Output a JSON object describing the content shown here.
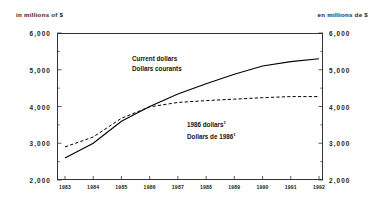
{
  "header": {
    "unit_left": "in millions of $",
    "unit_right": "en millions de $"
  },
  "annotations": {
    "current_en": "Current dollars",
    "current_fr": "Dollars courants",
    "constant_en": "1986 dollars",
    "constant_fr": "Dollars de 1986",
    "footnote_marker": "1"
  },
  "chart_data": {
    "type": "line",
    "title": "",
    "subtitle": "",
    "xlabel": "",
    "ylabel": "in millions of $",
    "ylabel_right": "en millions de $",
    "x": [
      1983,
      1984,
      1985,
      1986,
      1987,
      1988,
      1989,
      1990,
      1991,
      1992
    ],
    "categories": [
      "1983",
      "1984",
      "1985",
      "1986",
      "1987",
      "1988",
      "1989",
      "1990",
      "1991",
      "1992"
    ],
    "ylim": [
      2000,
      6000
    ],
    "yticks": [
      2000,
      3000,
      4000,
      5000,
      6000
    ],
    "ytick_labels": [
      "2,000",
      "3,000",
      "4,000",
      "5,000",
      "6,000"
    ],
    "yminor_step": 500,
    "grid": false,
    "legend": "annotation",
    "series": [
      {
        "name": "Current dollars / Dollars courants",
        "style": "solid",
        "color": "#000000",
        "values": [
          2600,
          3000,
          3600,
          4000,
          4340,
          4620,
          4880,
          5100,
          5220,
          5300
        ]
      },
      {
        "name": "1986 dollars / Dollars de 1986",
        "style": "dashed",
        "color": "#000000",
        "values": [
          2900,
          3170,
          3680,
          3990,
          4110,
          4160,
          4200,
          4240,
          4270,
          4270
        ]
      }
    ]
  }
}
